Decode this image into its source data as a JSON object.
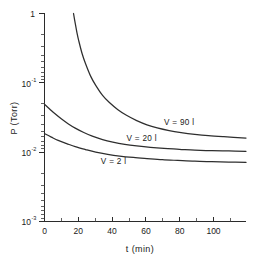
{
  "chart_data": {
    "type": "line",
    "title": "",
    "subtitle": "",
    "xlabel": "t (min)",
    "ylabel": "P (Torr)",
    "xscale": "linear",
    "yscale": "log",
    "xlim": [
      0,
      118
    ],
    "ylim": [
      0.001,
      1
    ],
    "grid": false,
    "legend_position": "inline-annotations",
    "x_ticks_major": [
      0,
      20,
      40,
      60,
      80,
      100
    ],
    "x_ticks_major_labels": [
      "0",
      "20",
      "40",
      "60",
      "80",
      "100"
    ],
    "x_ticks_minor": [
      10,
      30,
      50,
      70,
      90,
      110
    ],
    "y_ticks_major": [
      1,
      0.1,
      0.01,
      0.001
    ],
    "y_ticks_major_labels": [
      "1",
      "10",
      "10",
      "10"
    ],
    "y_ticks_major_exponents": [
      "",
      "-1",
      "-2",
      "-3"
    ],
    "series": [
      {
        "name": "V = 90 l",
        "annotation": "V = 90 l",
        "x": [
          17,
          18,
          19,
          20,
          22,
          24,
          27,
          30,
          34,
          38,
          43,
          48,
          54,
          60,
          66,
          73,
          80,
          88,
          96,
          105,
          118
        ],
        "y": [
          1.0,
          0.72,
          0.53,
          0.41,
          0.265,
          0.19,
          0.125,
          0.092,
          0.066,
          0.052,
          0.041,
          0.034,
          0.0285,
          0.0248,
          0.0224,
          0.0205,
          0.0192,
          0.0181,
          0.0173,
          0.0167,
          0.016
        ]
      },
      {
        "name": "V = 20 l",
        "annotation": "V = 20 l",
        "x": [
          0,
          3,
          6,
          10,
          14,
          18,
          23,
          28,
          34,
          40,
          47,
          54,
          62,
          70,
          79,
          88,
          98,
          108,
          118
        ],
        "y": [
          0.049,
          0.042,
          0.036,
          0.03,
          0.0255,
          0.0222,
          0.0192,
          0.017,
          0.0152,
          0.014,
          0.013,
          0.0123,
          0.0117,
          0.0113,
          0.011,
          0.0107,
          0.0105,
          0.0104,
          0.0103
        ]
      },
      {
        "name": "V = 2 l",
        "annotation": "V = 2 l",
        "x": [
          0,
          4,
          8,
          13,
          18,
          24,
          30,
          37,
          44,
          52,
          60,
          69,
          78,
          88,
          98,
          108,
          118
        ],
        "y": [
          0.0185,
          0.0165,
          0.0148,
          0.0133,
          0.012,
          0.0109,
          0.01,
          0.0093,
          0.0088,
          0.0084,
          0.0081,
          0.0078,
          0.0076,
          0.0074,
          0.0073,
          0.0072,
          0.0071
        ]
      }
    ],
    "annotations": [
      {
        "text": "V = 90 l",
        "x_data": 70,
        "y_data": 0.0245
      },
      {
        "text": "V = 20 l",
        "x_data": 48,
        "y_data": 0.0145
      },
      {
        "text": "V = 2 l",
        "x_data": 33,
        "y_data": 0.0068
      }
    ]
  },
  "axes": {
    "y_title": "P (Torr)",
    "x_title": "t (min)",
    "y_label_1": "1",
    "y_label_m1_base": "10",
    "y_label_m1_exp": "-1",
    "y_label_m2_base": "10",
    "y_label_m2_exp": "-2",
    "y_label_m3_base": "10",
    "y_label_m3_exp": "-3",
    "x_label_0": "0",
    "x_label_20": "20",
    "x_label_40": "40",
    "x_label_60": "60",
    "x_label_80": "80",
    "x_label_100": "100"
  },
  "series_labels": {
    "v90": "V = 90 l",
    "v20": "V = 20 l",
    "v2": "V = 2 l"
  },
  "colors": {
    "background": "#ffffff",
    "ink": "#2b2b2b",
    "curve": "#2e2e2e"
  }
}
